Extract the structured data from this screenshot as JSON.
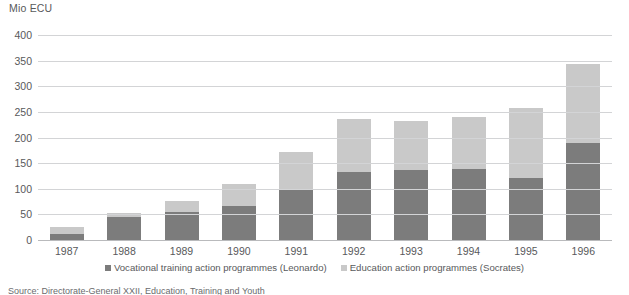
{
  "axis_unit_label": "Mio ECU",
  "legend": [
    {
      "label": "Vocational training action programmes (Leonardo)",
      "key": "voc",
      "color": "#7c7c7c"
    },
    {
      "label": "Education action programmes (Socrates)",
      "key": "edu",
      "color": "#c9c9c9"
    }
  ],
  "source_note": "Source: Directorate-General XXII, Education, Training and Youth",
  "chart_data": {
    "type": "bar",
    "stacked": true,
    "title": "",
    "subtitle": "",
    "xlabel": "",
    "ylabel": "Mio ECU",
    "ylim": [
      0,
      400
    ],
    "yticks": [
      0,
      50,
      100,
      150,
      200,
      250,
      300,
      350,
      400
    ],
    "grid": true,
    "legend_position": "bottom",
    "categories": [
      "1987",
      "1988",
      "1989",
      "1990",
      "1991",
      "1992",
      "1993",
      "1994",
      "1995",
      "1996"
    ],
    "series": [
      {
        "name": "Vocational training action programmes (Leonardo)",
        "color": "#7c7c7c",
        "values": [
          12,
          44,
          55,
          66,
          97,
          133,
          136,
          138,
          121,
          190
        ]
      },
      {
        "name": "Education action programmes (Socrates)",
        "color": "#c9c9c9",
        "values": [
          13,
          8,
          22,
          44,
          74,
          104,
          97,
          102,
          137,
          153
        ]
      }
    ],
    "totals": [
      25,
      52,
      77,
      110,
      171,
      237,
      233,
      240,
      258,
      343
    ]
  }
}
